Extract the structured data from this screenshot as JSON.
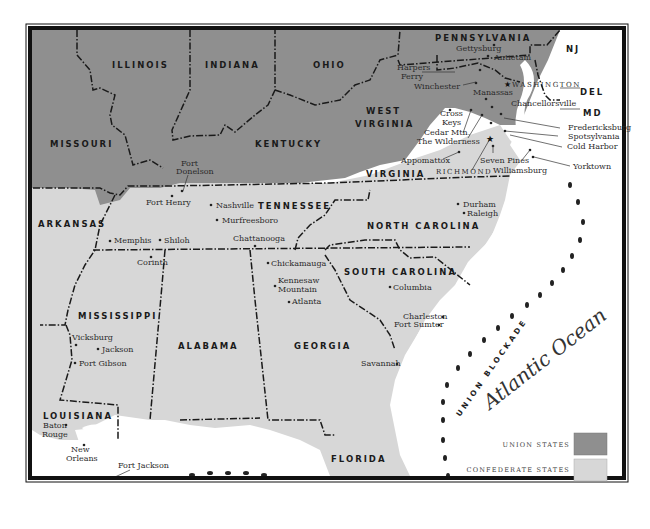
{
  "map": {
    "colors": {
      "union": "#8f8f8f",
      "confederate": "#d7d7d7",
      "ocean": "#ffffff",
      "frame": "#111111"
    },
    "states": [
      {
        "name": "ILLINOIS",
        "side": "union"
      },
      {
        "name": "INDIANA",
        "side": "union"
      },
      {
        "name": "OHIO",
        "side": "union"
      },
      {
        "name": "PENNSYLVANIA",
        "side": "union"
      },
      {
        "name": "NJ",
        "side": "union"
      },
      {
        "name": "MISSOURI",
        "side": "union"
      },
      {
        "name": "KENTUCKY",
        "side": "union"
      },
      {
        "name": "WEST",
        "side": "union"
      },
      {
        "name": "VIRGINIA",
        "side": "union"
      },
      {
        "name": "DEL",
        "side": "union"
      },
      {
        "name": "MD",
        "side": "union"
      },
      {
        "name": "VIRGINIA",
        "side": "confederate"
      },
      {
        "name": "ARKANSAS",
        "side": "confederate"
      },
      {
        "name": "TENNESSEE",
        "side": "confederate"
      },
      {
        "name": "NORTH CAROLINA",
        "side": "confederate"
      },
      {
        "name": "SOUTH CAROLINA",
        "side": "confederate"
      },
      {
        "name": "MISSISSIPPI",
        "side": "confederate"
      },
      {
        "name": "ALABAMA",
        "side": "confederate"
      },
      {
        "name": "GEORGIA",
        "side": "confederate"
      },
      {
        "name": "LOUISIANA",
        "side": "confederate"
      },
      {
        "name": "FLORIDA",
        "side": "confederate"
      }
    ],
    "places": {
      "gettysburg": "Gettysburg",
      "antietam": "Antietam",
      "harpers_ferry_1": "Harpers",
      "harpers_ferry_2": "Ferry",
      "winchester": "Winchester",
      "washington": "WASHINGTON",
      "manassas": "Manassas",
      "chancellorsville": "Chancellorsville",
      "cross_keys_1": "Cross",
      "cross_keys_2": "Keys",
      "cedar_mtn": "Cedar Mtn.",
      "wilderness": "The Wilderness",
      "fredericksburg": "Fredericksburg",
      "spotsylvania": "Spotsylvania",
      "cold_harbor": "Cold Harbor",
      "appomattox": "Appomattox",
      "seven_pines": "Seven Pines",
      "richmond": "RICHMOND",
      "williamsburg": "Williamsburg",
      "yorktown": "Yorktown",
      "fort_donelson_1": "Fort",
      "fort_donelson_2": "Donelson",
      "fort_henry": "Fort Henry",
      "nashville": "Nashville",
      "murfreesboro": "Murfreesboro",
      "memphis": "Memphis",
      "shiloh": "Shiloh",
      "chattanooga": "Chattanooga",
      "corinth": "Corinth",
      "chickamauga": "Chickamauga",
      "kennesaw_1": "Kennesaw",
      "kennesaw_2": "Mountain",
      "atlanta": "Atlanta",
      "durham": "Durham",
      "raleigh": "Raleigh",
      "columbia": "Columbia",
      "charleston": "Charleston",
      "fort_sumter": "Fort Sumter",
      "savannah": "Savannah",
      "vicksburg": "Vicksburg",
      "jackson": "Jackson",
      "port_gibson": "Port Gibson",
      "baton_rouge_1": "Baton",
      "baton_rouge_2": "Rouge",
      "new_orleans_1": "New",
      "new_orleans_2": "Orleans",
      "fort_jackson": "Fort Jackson"
    },
    "blockade_label": "UNION BLOCKADE",
    "ocean_label": "Atlantic Ocean",
    "legend": [
      {
        "label": "UNION STATES",
        "color": "#8f8f8f"
      },
      {
        "label": "CONFEDERATE STATES",
        "color": "#d7d7d7"
      }
    ]
  }
}
